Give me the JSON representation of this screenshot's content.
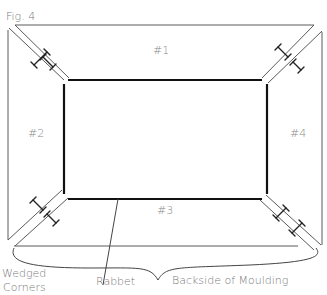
{
  "figure": {
    "title": "Fig. 4",
    "top_partial_text": "..., page",
    "pieces": [
      {
        "id": "piece-1",
        "label": "#1"
      },
      {
        "id": "piece-2",
        "label": "#2"
      },
      {
        "id": "piece-3",
        "label": "#3"
      },
      {
        "id": "piece-4",
        "label": "#4"
      }
    ],
    "callouts": {
      "wedged_corners_line1": "Wedged",
      "wedged_corners_line2": "Corners",
      "rabbet": "Rabbet",
      "backside": "Backside of Moulding"
    },
    "colors": {
      "outline": "#5a5a5a",
      "rabbet": "#111111",
      "text": "#7a7a7a"
    }
  }
}
